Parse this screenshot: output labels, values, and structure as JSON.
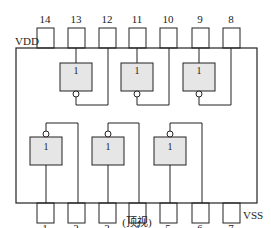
{
  "diagram": {
    "type": "ic-pinout",
    "supply_labels": {
      "vdd": "VDD",
      "vss": "VSS"
    },
    "view_label": "(顶视)",
    "gate_symbol": "1",
    "top_pins": [
      "14",
      "13",
      "12",
      "11",
      "10",
      "9",
      "8"
    ],
    "bottom_pins": [
      "1",
      "2",
      "3",
      "4",
      "5",
      "6",
      "7"
    ],
    "gates": [
      {
        "id": "g1",
        "input_pin": "13",
        "output_pin": "12",
        "row": "top"
      },
      {
        "id": "g2",
        "input_pin": "11",
        "output_pin": "10",
        "row": "top"
      },
      {
        "id": "g3",
        "input_pin": "9",
        "output_pin": "8",
        "row": "top"
      },
      {
        "id": "g4",
        "input_pin": "1",
        "output_pin": "2",
        "row": "bottom"
      },
      {
        "id": "g5",
        "input_pin": "3",
        "output_pin": "4",
        "row": "bottom"
      },
      {
        "id": "g6",
        "input_pin": "5",
        "output_pin": "6",
        "row": "bottom"
      }
    ],
    "colors": {
      "line": "#222222",
      "gate_fill": "#e6e6e6",
      "background": "#ffffff"
    }
  }
}
